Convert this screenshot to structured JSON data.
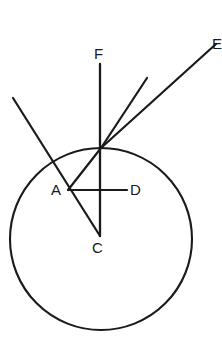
{
  "figure": {
    "background_color": "#ffffff",
    "stroke_color": "#1a1a1a",
    "width": 222,
    "height": 352
  },
  "labels": {
    "F": "F",
    "E": "E",
    "A": "A",
    "D": "D",
    "C": "C"
  },
  "geometry": {
    "circle": {
      "name": "main-circle",
      "cx": 101,
      "cy": 239,
      "r": 91,
      "stroke_width": 2.1
    },
    "points": {
      "tangent_point": {
        "x": 101,
        "y": 147,
        "label": ""
      },
      "A": {
        "x": 68,
        "y": 190,
        "label": "A"
      },
      "C": {
        "x": 100,
        "y": 236,
        "label": "C"
      },
      "D": {
        "x": 127,
        "y": 190,
        "label": "D"
      },
      "F_end": {
        "x": 100,
        "y": 64,
        "label": "F"
      },
      "E_end": {
        "x": 216,
        "y": 44,
        "label": "E"
      },
      "ray2_end": {
        "x": 147,
        "y": 78,
        "label": ""
      },
      "secant_start": {
        "x": 13,
        "y": 98,
        "label": ""
      },
      "secant_end": {
        "x": 100,
        "y": 236,
        "label": ""
      }
    },
    "segments": [
      {
        "name": "line-F-to-C",
        "x1": 100,
        "y1": 64,
        "x2": 100,
        "y2": 236,
        "width": 2.3
      },
      {
        "name": "ray-tangent-to-E",
        "x1": 101,
        "y1": 148,
        "x2": 216,
        "y2": 44,
        "width": 2.2
      },
      {
        "name": "ray-tangent-to-upper-right",
        "x1": 101,
        "y1": 148,
        "x2": 147,
        "y2": 78,
        "width": 2.2
      },
      {
        "name": "secant-through-A",
        "x1": 13,
        "y1": 98,
        "x2": 100,
        "y2": 236,
        "width": 2.2
      },
      {
        "name": "segment-tangent-to-A",
        "x1": 101,
        "y1": 148,
        "x2": 68,
        "y2": 190,
        "width": 2.2
      },
      {
        "name": "segment-A-to-D",
        "x1": 68,
        "y1": 190,
        "x2": 127,
        "y2": 190,
        "width": 2.2
      }
    ],
    "label_positions": {
      "F": {
        "left": 94,
        "top": 46
      },
      "E": {
        "left": 212,
        "top": 36
      },
      "A": {
        "left": 51,
        "top": 182
      },
      "D": {
        "left": 130,
        "top": 182
      },
      "C": {
        "left": 92,
        "top": 240
      }
    }
  }
}
